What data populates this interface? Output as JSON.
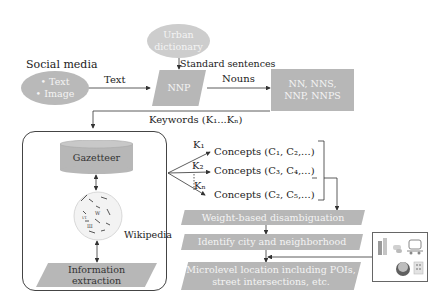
{
  "diagram": {
    "social_media": {
      "title": "Social media",
      "items": [
        "• Text",
        "• Image"
      ]
    },
    "urban_dictionary": {
      "line1": "Urban",
      "line2": "dictionary"
    },
    "labels": {
      "text_edge": "Text",
      "standard_sentences": "Standard sentences",
      "nouns_edge": "Nouns",
      "keywords": "Keywords (K₁...Kₙ)",
      "wikipedia": "Wikipedia"
    },
    "nnp_box": "NNP",
    "noun_tags": {
      "line1": "NN, NNS,",
      "line2": "NNP, NNPS"
    },
    "knowledge_box": {
      "gazetteer": "Gazetteer",
      "info_extraction_line1": "Information",
      "info_extraction_line2": "extraction"
    },
    "keyword_branches": [
      {
        "k": "K₁",
        "concepts": "Concepts (C₁, C₂,...)"
      },
      {
        "k": "K₂",
        "concepts": "Concepts (C₃, C₄,...)"
      },
      {
        "k": "Kₙ",
        "concepts": "Concepts (C₂, C₅,...)"
      }
    ],
    "pipeline_steps": [
      {
        "line1": "Weight-based disambiguation"
      },
      {
        "line1": "Identify city and neighborhood"
      },
      {
        "line1": "Microlevel location including POIs,",
        "line2": "street intersections, etc."
      }
    ],
    "poi_icons": [
      "building-icon",
      "chat-icon",
      "car-icon",
      "globe-building-icon",
      "office-icon"
    ],
    "colors": {
      "shape_fill": "#b7b7b7",
      "shape_text": "#f4f4f4",
      "line": "#333333"
    }
  }
}
